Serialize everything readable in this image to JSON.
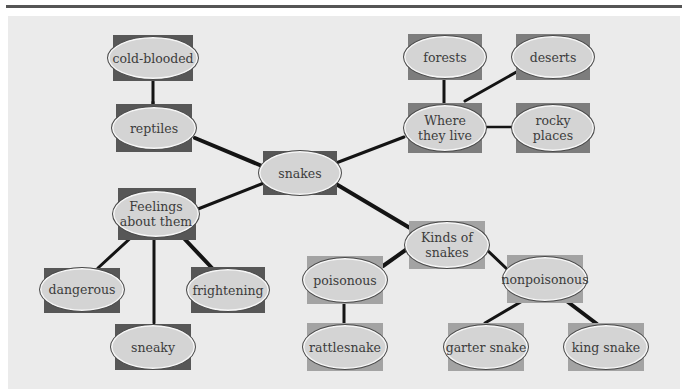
{
  "diagram": {
    "type": "concept-web",
    "center": "snakes",
    "colors": {
      "panel": "#ebebeb",
      "ellipse": "#d4d4d4",
      "rect_dark": "#575757",
      "rect_mid": "#7d7d7d",
      "rect_light": "#a3a3a3",
      "edge": "#141414"
    },
    "nodes": {
      "cold_blooded": "cold-blooded",
      "reptiles": "reptiles",
      "snakes": "snakes",
      "feelings": "Feelings\nabout them",
      "dangerous": "dangerous",
      "sneaky": "sneaky",
      "frightening": "frightening",
      "forests": "forests",
      "deserts": "deserts",
      "where": "Where\nthey live",
      "rocky": "rocky\nplaces",
      "kinds": "Kinds of\nsnakes",
      "poisonous": "poisonous",
      "nonpoisonous": "nonpoisonous",
      "rattlesnake": "rattlesnake",
      "garter": "garter snake",
      "king": "king snake"
    },
    "edges": [
      [
        "snakes",
        "reptiles"
      ],
      [
        "reptiles",
        "cold-blooded"
      ],
      [
        "snakes",
        "Where they live"
      ],
      [
        "Where they live",
        "forests"
      ],
      [
        "Where they live",
        "deserts"
      ],
      [
        "Where they live",
        "rocky places"
      ],
      [
        "snakes",
        "Feelings about them"
      ],
      [
        "Feelings about them",
        "dangerous"
      ],
      [
        "Feelings about them",
        "sneaky"
      ],
      [
        "Feelings about them",
        "frightening"
      ],
      [
        "snakes",
        "Kinds of snakes"
      ],
      [
        "Kinds of snakes",
        "poisonous"
      ],
      [
        "Kinds of snakes",
        "nonpoisonous"
      ],
      [
        "poisonous",
        "rattlesnake"
      ],
      [
        "nonpoisonous",
        "garter snake"
      ],
      [
        "nonpoisonous",
        "king snake"
      ]
    ]
  }
}
